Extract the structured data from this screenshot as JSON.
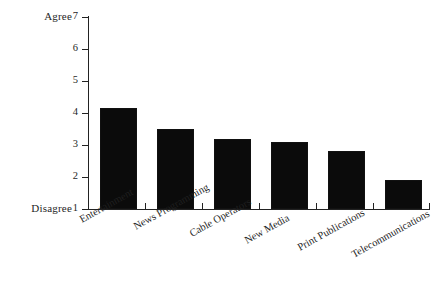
{
  "chart_data": {
    "type": "bar",
    "title": "",
    "subtitle": "",
    "xlabel": "",
    "ylabel": "",
    "categories": [
      "Entertainment",
      "News Programming",
      "Cable Operators",
      "New Media",
      "Print Publications",
      "Telecommunications"
    ],
    "values": [
      4.15,
      3.5,
      3.2,
      3.1,
      2.8,
      1.9
    ],
    "ylim": [
      1,
      7
    ],
    "ytick_labels": [
      "7",
      "6",
      "5",
      "4",
      "3",
      "2",
      "1"
    ],
    "ytick_values": [
      7,
      6,
      5,
      4,
      3,
      2,
      1
    ],
    "y_axis_top_label": "Agree",
    "y_axis_bottom_label": "Disagree",
    "grid": false,
    "legend": null,
    "bar_color": "#0b0b0b",
    "axis_color": "#222222",
    "background_color": "#ffffff"
  }
}
